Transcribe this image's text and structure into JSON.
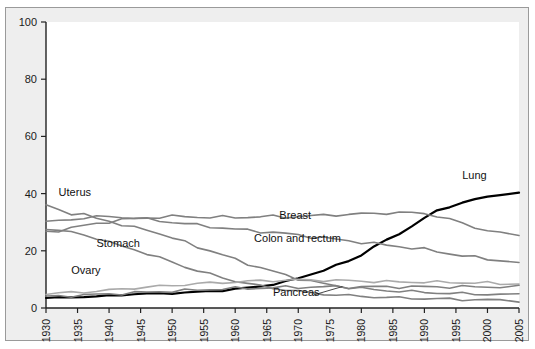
{
  "figure": {
    "background_color": "#eeeeee",
    "plot_background_color": "#ffffff",
    "border_color": "#9a9a9a",
    "note": "Rate per 100,000"
  },
  "chart_data": {
    "type": "line",
    "title": "",
    "subtitle": "",
    "xlabel": "",
    "ylabel": "Rate per 100,000",
    "xlim": [
      1930,
      2005
    ],
    "ylim": [
      0,
      100
    ],
    "grid": false,
    "legend_position": "inline-labels",
    "xticks": [
      1930,
      1935,
      1940,
      1945,
      1950,
      1955,
      1960,
      1965,
      1970,
      1975,
      1980,
      1985,
      1990,
      1995,
      2000,
      2005
    ],
    "yticks": [
      0,
      20,
      40,
      60,
      80,
      100
    ],
    "x": [
      1930,
      1932,
      1934,
      1936,
      1938,
      1940,
      1942,
      1944,
      1946,
      1948,
      1950,
      1952,
      1954,
      1956,
      1958,
      1960,
      1962,
      1964,
      1966,
      1968,
      1970,
      1972,
      1974,
      1976,
      1978,
      1980,
      1982,
      1984,
      1986,
      1988,
      1990,
      1992,
      1994,
      1996,
      1998,
      2000,
      2002,
      2005
    ],
    "series": [
      {
        "name": "Lung",
        "color": "#000000",
        "width": 2.2,
        "label_x": 1996,
        "label_y": 45,
        "values": [
          3.5,
          3.6,
          3.8,
          4.0,
          4.0,
          4.3,
          4.6,
          4.9,
          5.0,
          5.1,
          5.2,
          5.4,
          5.6,
          5.9,
          6.2,
          6.6,
          7.0,
          7.6,
          8.3,
          9.2,
          10.4,
          11.8,
          13.2,
          14.8,
          16.5,
          18.5,
          21.6,
          23.6,
          26.0,
          28.6,
          31.5,
          33.9,
          35.5,
          36.8,
          38.0,
          38.8,
          39.8,
          40.2
        ]
      },
      {
        "name": "Uterus",
        "color": "#808080",
        "width": 1.6,
        "label_x": 1932,
        "label_y": 39,
        "values": [
          36.0,
          34.5,
          33.0,
          32.5,
          31.5,
          30.5,
          29.0,
          28.0,
          27.5,
          26.0,
          24.5,
          23.0,
          21.5,
          20.0,
          18.5,
          17.0,
          15.5,
          14.0,
          12.8,
          11.5,
          10.3,
          9.3,
          8.5,
          7.8,
          7.2,
          6.8,
          6.4,
          6.1,
          5.9,
          5.7,
          5.5,
          5.3,
          5.1,
          5.0,
          4.9,
          4.8,
          4.7,
          4.6
        ]
      },
      {
        "name": "Stomach",
        "color": "#808080",
        "width": 1.6,
        "label_x": 1938,
        "label_y": 21.5,
        "values": [
          28.0,
          27.0,
          26.5,
          25.5,
          24.5,
          23.0,
          21.5,
          20.5,
          19.0,
          17.5,
          16.0,
          14.5,
          13.0,
          11.8,
          10.6,
          9.5,
          8.5,
          7.7,
          7.0,
          6.4,
          5.8,
          5.3,
          4.9,
          4.6,
          4.3,
          4.1,
          3.9,
          3.7,
          3.5,
          3.4,
          3.3,
          3.2,
          3.1,
          3.0,
          2.9,
          2.8,
          2.7,
          2.6
        ]
      },
      {
        "name": "Colon and rectum",
        "color": "#808080",
        "width": 1.6,
        "label_x": 1963,
        "label_y": 23,
        "values": [
          30.0,
          30.5,
          31.0,
          31.5,
          31.8,
          32.0,
          31.8,
          31.5,
          31.0,
          30.5,
          30.0,
          29.5,
          29.0,
          28.5,
          28.0,
          27.5,
          27.2,
          26.8,
          26.4,
          26.0,
          25.5,
          25.0,
          24.5,
          24.0,
          23.5,
          23.0,
          22.5,
          22.0,
          21.5,
          21.0,
          20.5,
          19.8,
          19.0,
          18.3,
          17.7,
          17.2,
          16.6,
          15.9
        ]
      },
      {
        "name": "Breast",
        "color": "#808080",
        "width": 1.6,
        "label_x": 1967,
        "label_y": 31,
        "values": [
          26.5,
          27.2,
          28.0,
          28.8,
          29.5,
          30.2,
          30.8,
          31.2,
          31.5,
          31.8,
          32.0,
          32.0,
          31.8,
          31.7,
          31.8,
          31.7,
          31.8,
          31.9,
          32.0,
          31.8,
          32.0,
          32.2,
          32.4,
          32.6,
          32.7,
          32.9,
          33.0,
          33.2,
          33.4,
          33.2,
          33.1,
          32.2,
          31.0,
          29.6,
          28.2,
          27.2,
          26.2,
          25.3
        ]
      },
      {
        "name": "Ovary",
        "color": "#aaaaaa",
        "width": 1.6,
        "label_x": 1934,
        "label_y": 12,
        "values": [
          5.0,
          5.2,
          5.4,
          5.6,
          5.9,
          6.2,
          6.6,
          7.0,
          7.3,
          7.6,
          7.9,
          8.2,
          8.5,
          8.7,
          8.9,
          9.1,
          9.3,
          9.5,
          9.6,
          9.7,
          9.8,
          9.8,
          9.7,
          9.6,
          9.5,
          9.4,
          9.3,
          9.2,
          9.1,
          9.1,
          9.1,
          9.0,
          9.0,
          8.9,
          8.8,
          8.7,
          8.6,
          8.5
        ]
      },
      {
        "name": "Pancreas",
        "color": "#808080",
        "width": 1.6,
        "label_x": 1966,
        "label_y": 4.2,
        "values": [
          4.0,
          4.1,
          4.3,
          4.5,
          4.7,
          4.9,
          5.1,
          5.3,
          5.5,
          5.7,
          5.9,
          6.1,
          6.3,
          6.5,
          6.7,
          6.8,
          6.9,
          7.0,
          7.1,
          7.2,
          7.3,
          7.3,
          7.4,
          7.4,
          7.4,
          7.4,
          7.4,
          7.4,
          7.4,
          7.4,
          7.4,
          7.4,
          7.4,
          7.4,
          7.4,
          7.4,
          7.4,
          7.4
        ]
      }
    ],
    "annotations": [
      {
        "name": "pancreas-leader",
        "from_x": 1972.5,
        "from_y": 4.6,
        "to_x": 1977,
        "to_y": 7.5
      }
    ]
  }
}
